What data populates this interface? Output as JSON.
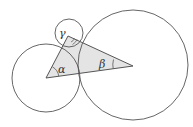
{
  "diagram": {
    "type": "three mutually tangent circles with triangle of centers",
    "colors": {
      "stroke": "#555555",
      "triangle_fill": "#e4e4e4",
      "background": "#ffffff"
    },
    "circles": [
      {
        "name": "left-circle",
        "cx": 46,
        "cy": 78,
        "r": 34
      },
      {
        "name": "small-circle",
        "cx": 69,
        "cy": 33,
        "r": 14
      },
      {
        "name": "large-circle",
        "cx": 133,
        "cy": 65,
        "r": 55
      }
    ],
    "triangle": {
      "vertices": [
        [
          46,
          78
        ],
        [
          133,
          66
        ],
        [
          68,
          36
        ]
      ]
    },
    "angles": {
      "alpha": {
        "label": "α",
        "vertex": [
          46,
          78
        ]
      },
      "beta": {
        "label": "β",
        "vertex": [
          133,
          66
        ]
      },
      "gamma": {
        "label": "γ",
        "vertex": [
          68,
          36
        ]
      }
    }
  }
}
